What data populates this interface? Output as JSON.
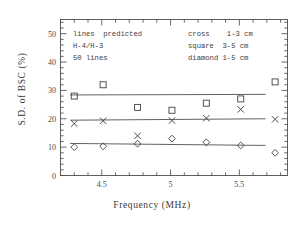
{
  "chart_data": {
    "type": "scatter",
    "title": "",
    "xlabel": "Frequency (MHz)",
    "ylabel": "S.D. of BSC (%)",
    "xlim": [
      4.2,
      5.85
    ],
    "ylim": [
      0,
      55
    ],
    "xticks": [
      4.5,
      5,
      5.5
    ],
    "xtick_labels": [
      "4.5",
      "5",
      "5.5"
    ],
    "yticks": [
      0,
      10,
      20,
      30,
      40,
      50
    ],
    "ytick_labels": [
      "0",
      "10",
      "20",
      "30",
      "40",
      "50"
    ],
    "xminor_step": 0.1,
    "yminor_step": 2,
    "grid": false,
    "legend_position": "inside-top-right",
    "x": [
      4.3,
      4.51,
      4.76,
      5.01,
      5.26,
      5.51,
      5.76
    ],
    "series": [
      {
        "name": "square",
        "label": "square  3-5 cm",
        "marker": "square",
        "range": "3-5 cm",
        "values": [
          28.0,
          32.0,
          24.0,
          23.0,
          25.5,
          27.0,
          33.0
        ],
        "fit_line": {
          "x0": 4.27,
          "y0": 28.4,
          "x1": 5.69,
          "y1": 28.6
        }
      },
      {
        "name": "cross",
        "label": "cross   1-3 cm",
        "marker": "cross",
        "range": "1-3 cm",
        "values": [
          18.3,
          19.3,
          14.0,
          19.4,
          20.2,
          23.3,
          19.8
        ],
        "fit_line": {
          "x0": 4.27,
          "y0": 19.5,
          "x1": 5.69,
          "y1": 20.0
        }
      },
      {
        "name": "diamond",
        "label": "diamond 1-5 cm",
        "marker": "diamond",
        "range": "1-5 cm",
        "values": [
          10.0,
          10.3,
          11.2,
          13.0,
          11.7,
          10.6,
          8.0
        ],
        "fit_line": {
          "x0": 4.27,
          "y0": 11.3,
          "x1": 5.69,
          "y1": 10.6
        }
      }
    ],
    "annotations_left": [
      "lines  predicted",
      "H-4/H-3",
      "50 lines"
    ],
    "annotations_right": [
      "cross    1-3 cm",
      "square  3-5 cm",
      "diamond 1-5 cm"
    ],
    "line_color": "#585858",
    "marker_color": "#4a4a4a",
    "axis_color": "#4f4f4f"
  },
  "axes": {
    "x_title": "Frequency (MHz)",
    "y_title": "S.D. of BSC (%)"
  },
  "annotations": {
    "left": {
      "line1": "lines  predicted",
      "line2": "H-4/H-3",
      "line3": "50 lines"
    },
    "right": {
      "line1": "cross    1-3 cm",
      "line2": "square  3-5 cm",
      "line3": "diamond 1-5 cm"
    }
  }
}
